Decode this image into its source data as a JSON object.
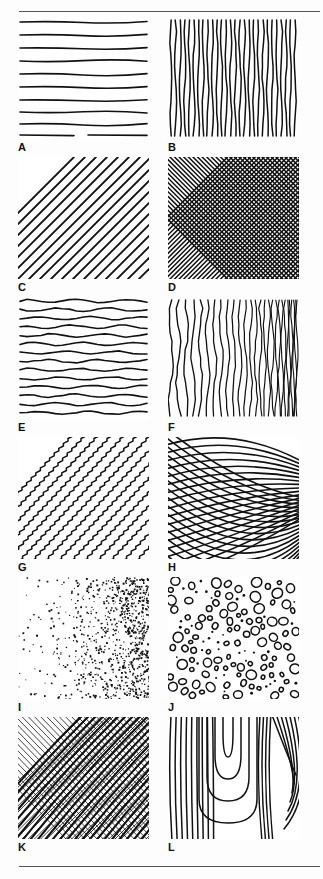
{
  "figure": {
    "caption": "",
    "background_color": "#ffffff",
    "ink_color": "#111111",
    "rule_color": "#555555",
    "columns": 2,
    "rows": 6
  },
  "panels": [
    {
      "label": "A",
      "name": "horizontal-straight-lines",
      "description": "Evenly spaced horizontal hand-drawn straight lines",
      "line_count": 10,
      "orientation": "horizontal",
      "density": "medium"
    },
    {
      "label": "B",
      "name": "vertical-straight-lines",
      "description": "Evenly spaced vertical hand-drawn straight lines",
      "line_count": 28,
      "orientation": "vertical",
      "density": "high"
    },
    {
      "label": "C",
      "name": "diagonal-straight-lines",
      "description": "Parallel diagonal lines running lower-left to upper-right",
      "line_count": 13,
      "orientation": "diagonal",
      "density": "low"
    },
    {
      "label": "D",
      "name": "diagonal-crosshatch",
      "description": "Dense diagonal crosshatch mesh in both diagonal directions",
      "line_count": 76,
      "orientation": "crosshatch",
      "density": "very-high"
    },
    {
      "label": "E",
      "name": "wavy-horizontal-lines",
      "description": "Horizontal lines with gentle wave undulation",
      "line_count": 14,
      "orientation": "horizontal",
      "density": "medium"
    },
    {
      "label": "F",
      "name": "wavy-vertical-gradient",
      "description": "Wavy vertical lines with density increasing toward the right edge",
      "line_count": 30,
      "orientation": "vertical",
      "density": "gradient-left-to-right"
    },
    {
      "label": "G",
      "name": "zigzag-diagonal-lines",
      "description": "Stepped zigzag strokes arranged on diagonal bands",
      "line_count": 12,
      "orientation": "diagonal",
      "density": "medium"
    },
    {
      "label": "H",
      "name": "curved-crosshatch-mesh",
      "description": "Curved crosshatch net converging toward the right side",
      "line_count": 36,
      "orientation": "curved-crosshatch",
      "density": "gradient-left-to-right"
    },
    {
      "label": "I",
      "name": "stipple-dot-gradient",
      "description": "Stipple dots with density increasing from left to right",
      "dot_count": 900,
      "orientation": "random",
      "density": "gradient-left-to-right"
    },
    {
      "label": "J",
      "name": "pebble-outline-texture",
      "description": "Scattered small open circles and filled dots resembling pebbles",
      "shape_count": 140,
      "orientation": "random",
      "density": "medium"
    },
    {
      "label": "K",
      "name": "curved-contour-crosshatch",
      "description": "Curved contour crosshatch, fine grid crossed by heavy curved strokes",
      "line_count": 56,
      "orientation": "curved-crosshatch",
      "density": "high"
    },
    {
      "label": "L",
      "name": "wood-grain-contours",
      "description": "Nested U-shaped wood grain contour lines around a knot",
      "line_count": 20,
      "orientation": "curved",
      "density": "low"
    }
  ]
}
